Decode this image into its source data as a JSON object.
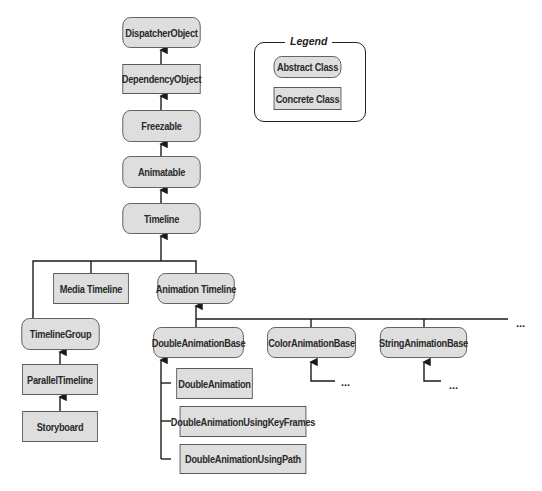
{
  "legend": {
    "title": "Legend",
    "abstract_label": "Abstract Class",
    "concrete_label": "Concrete Class"
  },
  "nodes": {
    "dispatcher_object": "DispatcherObject",
    "dependency_object": "DependencyObject",
    "freezable": "Freezable",
    "animatable": "Animatable",
    "timeline": "Timeline",
    "media_timeline": "Media Timeline",
    "animation_timeline": "Animation Timeline",
    "timeline_group": "TimelineGroup",
    "parallel_timeline": "ParallelTimeline",
    "storyboard": "Storyboard",
    "double_animation_base": "DoubleAnimationBase",
    "color_animation_base": "ColorAnimationBase",
    "string_animation_base": "StringAnimationBase",
    "double_animation": "DoubleAnimation",
    "double_animation_keyframes": "DoubleAnimationUsingKeyFrames",
    "double_animation_path": "DoubleAnimationUsingPath"
  },
  "ellipsis": "..."
}
